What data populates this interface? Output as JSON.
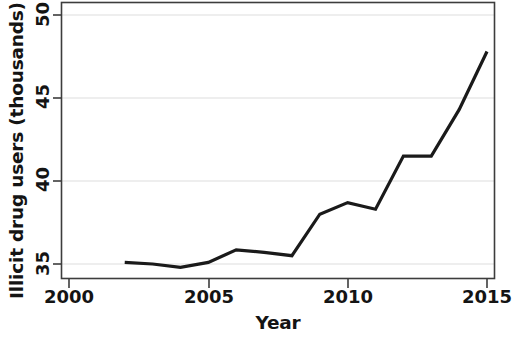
{
  "chart_data": {
    "type": "line",
    "title": "",
    "xlabel": "Year",
    "ylabel": "Illicit drug users (thousands)",
    "x": [
      2002,
      2003,
      2004,
      2005,
      2006,
      2007,
      2008,
      2009,
      2010,
      2011,
      2012,
      2013,
      2014,
      2015
    ],
    "values": [
      35.1,
      35.0,
      34.8,
      35.1,
      35.85,
      35.7,
      35.5,
      38.0,
      38.7,
      38.3,
      41.5,
      41.5,
      44.3,
      47.8
    ],
    "series": [
      {
        "name": "Illicit drug users",
        "values": [
          35.1,
          35.0,
          34.8,
          35.1,
          35.85,
          35.7,
          35.5,
          38.0,
          38.7,
          38.3,
          41.5,
          41.5,
          44.3,
          47.8
        ]
      }
    ],
    "xlim": [
      2000,
      2015.3
    ],
    "ylim": [
      34.0,
      50.35
    ],
    "xticks": [
      2000,
      2005,
      2010,
      2015
    ],
    "xtick_labels": [
      "2000",
      "2005",
      "2010",
      "2015"
    ],
    "yticks": [
      35,
      40,
      45,
      50
    ],
    "ytick_labels": [
      "35",
      "40",
      "45",
      "50"
    ],
    "grid": true,
    "grid_axis": "y",
    "legend": null,
    "legend_position": "none",
    "line_color": "#1a1a1a",
    "line_width": 3.2,
    "grid_color": "#e8e8e8",
    "axis_color": "#3a3a3a",
    "background": "#ffffff"
  }
}
